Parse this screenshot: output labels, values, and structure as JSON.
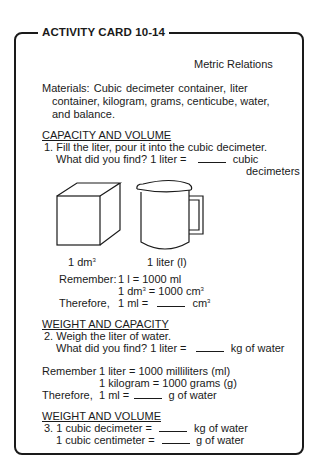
{
  "card": {
    "title": "ACTIVITY CARD 10-14",
    "subtitle": "Metric Relations",
    "materials": {
      "line1": "Materials:  Cubic  decimeter  container,  liter",
      "line2": "container, kilogram, grams, centicube, water,",
      "line3": "and balance."
    }
  },
  "sections": [
    {
      "heading": "CAPACITY AND VOLUME",
      "step": "1.  Fill the liter, pour it into the cubic decimeter.",
      "question": "What  did  you  find?   1  liter  =",
      "question_after": "cubic",
      "question_after2": "decimeters",
      "illustrations": [
        {
          "icon": "cube-icon",
          "label": "1 dm",
          "label_sup": "3"
        },
        {
          "icon": "pitcher-icon",
          "label": "1 liter (l)"
        }
      ],
      "remember_label": "Remember:",
      "remember_1": "1 l = 1000 ml",
      "remember_2a": "1 dm",
      "remember_2b": " = 1000 cm",
      "therefore_label": "Therefore,",
      "therefore_a": "1 ml =",
      "therefore_b": "cm"
    },
    {
      "heading": "WEIGHT AND CAPACITY",
      "step": "2.  Weigh the liter of water.",
      "question": "What did you find?  1 liter =",
      "question_after": "kg of water",
      "remember_label": "Remember",
      "remember_1": "1 liter = 1000 milliliters (ml)",
      "remember_2": "1 kilogram = 1000 grams (g)",
      "therefore_label": "Therefore,",
      "therefore_a": "1 ml =",
      "therefore_b": "g of water"
    },
    {
      "heading": "WEIGHT AND VOLUME",
      "line1_a": "3.  1 cubic decimeter =",
      "line1_b": "kg of water",
      "line2_a": "1 cubic centimeter =",
      "line2_b": "g of water"
    }
  ]
}
